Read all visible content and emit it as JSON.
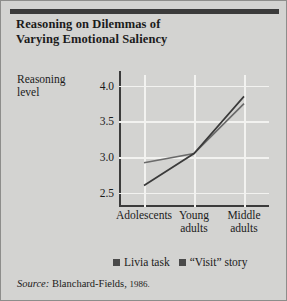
{
  "figure": {
    "title_line1": "Reasoning on Dilemmas of",
    "title_line2": "Varying Emotional Saliency",
    "background_color": "#d3d3d1",
    "rule_color": "#3b3b3b"
  },
  "source": {
    "label": "Source:",
    "citation": "Blanchard-Fields,",
    "year": "1986."
  },
  "legend": {
    "items": [
      {
        "label": "Livia task",
        "color": "#4a4a4a"
      },
      {
        "label": "“Visit” story",
        "color": "#4a4a4a"
      }
    ]
  },
  "chart_data": {
    "type": "line",
    "title": "Reasoning on Dilemmas of Varying Emotional Saliency",
    "xlabel": "",
    "ylabel": "Reasoning level",
    "ylabel_line1": "Reasoning",
    "ylabel_line2": "level",
    "categories": [
      "Adolescents",
      "Young adults",
      "Middle adults"
    ],
    "category_lines": [
      [
        "Adolescents"
      ],
      [
        "Young",
        "adults"
      ],
      [
        "Middle",
        "adults"
      ]
    ],
    "ylim": [
      2.3,
      4.15
    ],
    "yticks": [
      2.5,
      3.0,
      3.5,
      4.0
    ],
    "ytick_labels": [
      "2.5",
      "3.0",
      "3.5",
      "4.0"
    ],
    "grid": true,
    "legend_position": "bottom",
    "series": [
      {
        "name": "Livia task",
        "color": "#6a6a6a",
        "values": [
          2.92,
          3.05,
          3.75
        ]
      },
      {
        "name": "“Visit” story",
        "color": "#3a3a3a",
        "values": [
          2.6,
          3.05,
          3.85
        ]
      }
    ]
  }
}
